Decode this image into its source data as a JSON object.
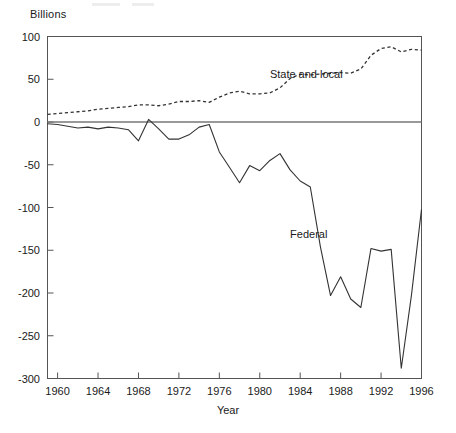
{
  "chart_data": {
    "type": "line",
    "title": "",
    "subtitle": "",
    "unit_label": "Billions",
    "xlabel": "Year",
    "ylabel": "",
    "xlim": [
      1959,
      1996
    ],
    "ylim": [
      -300,
      100
    ],
    "grid": false,
    "legend_position": "inline-annotations",
    "x_ticks": [
      1960,
      1964,
      1968,
      1972,
      1976,
      1980,
      1984,
      1988,
      1992,
      1996
    ],
    "x_tick_labels": [
      "1960",
      "1964",
      "1968",
      "1972",
      "1976",
      "1980",
      "1984",
      "1988",
      "1992",
      "1996"
    ],
    "y_ticks": [
      100,
      50,
      0,
      -50,
      -100,
      -150,
      -200,
      -250,
      -300
    ],
    "y_tick_labels": [
      "100",
      "50",
      "0",
      "-50",
      "-100",
      "-150",
      "-200",
      "-250",
      "-300"
    ],
    "x": [
      1959,
      1960,
      1961,
      1962,
      1963,
      1964,
      1965,
      1966,
      1967,
      1968,
      1969,
      1970,
      1971,
      1972,
      1973,
      1974,
      1975,
      1976,
      1977,
      1978,
      1979,
      1980,
      1981,
      1982,
      1983,
      1984,
      1985,
      1986,
      1987,
      1988,
      1989,
      1990,
      1991,
      1992,
      1993,
      1994,
      1995,
      1996
    ],
    "series": [
      {
        "name": "State and local",
        "style": "dashed",
        "label_x": 1981,
        "label_y": 55,
        "values": [
          9,
          10,
          11,
          12,
          13,
          15,
          16,
          17,
          18,
          20,
          20,
          19,
          21,
          24,
          24,
          25,
          23,
          29,
          34,
          36,
          33,
          33,
          34,
          40,
          51,
          56,
          55,
          56,
          57,
          58,
          57,
          62,
          78,
          86,
          88,
          82,
          85,
          84
        ]
      },
      {
        "name": "Federal",
        "style": "solid",
        "label_x": 1983,
        "label_y": -132,
        "values": [
          -2,
          -3,
          -5,
          -7,
          -6,
          -8,
          -6,
          -7,
          -9,
          -8,
          -22,
          -6,
          3,
          -1,
          -9,
          -18,
          -20,
          -19,
          -14,
          -10,
          -6,
          -3,
          -22,
          -35,
          -53,
          -71,
          -63,
          -51,
          -56,
          -45,
          -37,
          -55,
          -69,
          -76,
          -105,
          -130,
          -158,
          -180
        ]
      }
    ],
    "federal_values_annotated": {
      "1959": -2,
      "1960": -3,
      "1961": -5,
      "1962": -7,
      "1963": -6,
      "1964": -8,
      "1965": -6,
      "1966": -7,
      "1967": -9,
      "1968": -22,
      "1969": 3,
      "1970": -8,
      "1971": -20,
      "1972": -20,
      "1973": -15,
      "1974": -6,
      "1975": -3,
      "1976": -35,
      "1977": -53,
      "1978": -71,
      "1979": -51,
      "1980": -57,
      "1981": -45,
      "1982": -37,
      "1983": -56,
      "1984": -69,
      "1985": -76,
      "1986": -146,
      "1987": -203,
      "1988": -181,
      "1989": -207,
      "1990": -217,
      "1991": -148,
      "1992": -151,
      "1993": -149,
      "1994": -288,
      "1995": -203,
      "1996": -102
    }
  },
  "series_labels": {
    "state_and_local": "State and local",
    "federal": "Federal"
  },
  "axis": {
    "unit": "Billions",
    "xtitle": "Year"
  }
}
